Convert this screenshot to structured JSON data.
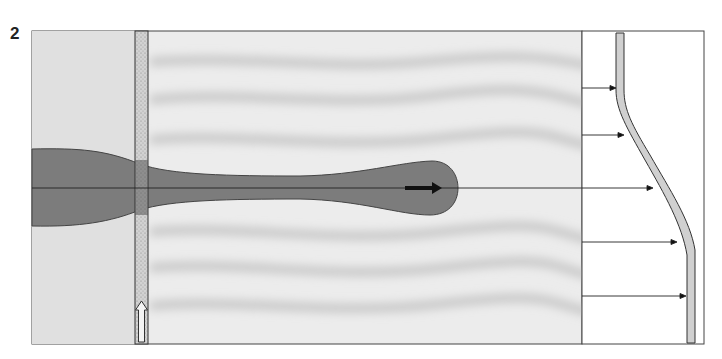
{
  "figure": {
    "label": "2",
    "top_clipped_text": "... ...y ...g...",
    "colors": {
      "background": "#ffffff",
      "flow_field": "#e4e4e4",
      "flow_bands": "#cfcfcf",
      "plume": "#7a7a7a",
      "plume_edge": "#4a4a4a",
      "porous_strip": "#c9c9c9",
      "profile_strip": "#cdcdcd",
      "lines": "#333333",
      "arrow": "#111111"
    },
    "panels": {
      "flow_field": {
        "x": 32,
        "y": 31,
        "width": 550,
        "height": 313
      },
      "profile_box": {
        "x": 582,
        "y": 31,
        "width": 122,
        "height": 313
      }
    },
    "elements": {
      "porous_strip": {
        "x": 135,
        "width": 13
      },
      "inlet_arrow": {
        "direction": "up",
        "x": 141,
        "y_top": 301,
        "y_bottom": 342
      },
      "centerline_y": 188,
      "plume_direction_arrow": {
        "x1": 405,
        "x2": 440,
        "y": 188
      },
      "profile_arrows_y": [
        88,
        135,
        188,
        242,
        296
      ]
    }
  }
}
